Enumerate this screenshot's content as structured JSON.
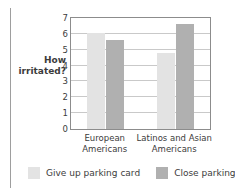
{
  "chart_data": {
    "type": "bar",
    "title": "",
    "xlabel": "",
    "ylabel": "How irritated?",
    "ylabel_lines": [
      "How",
      "irritated?"
    ],
    "ylim": [
      0,
      7
    ],
    "yticks": [
      0,
      1,
      2,
      3,
      4,
      5,
      6,
      7
    ],
    "grid": true,
    "legend_position": "bottom",
    "categories": [
      "European Americans",
      "Latinos and Asian Americans"
    ],
    "category_lines": [
      [
        "European",
        "Americans"
      ],
      [
        "Latinos and Asian",
        "Americans"
      ]
    ],
    "series": [
      {
        "name": "Give up parking card",
        "color": "#e3e3e3",
        "values": [
          6.05,
          4.8
        ]
      },
      {
        "name": "Close parking lot",
        "color": "#b0b0b0",
        "values": [
          5.6,
          6.65
        ]
      }
    ]
  },
  "axis": {
    "tick_0": "0",
    "tick_1": "1",
    "tick_2": "2",
    "tick_3": "3",
    "tick_4": "4",
    "tick_5": "5",
    "tick_6": "6",
    "tick_7": "7"
  },
  "colors": {
    "series_light": "#e3e3e3",
    "series_dark": "#b0b0b0",
    "gridline": "#c9c9c9",
    "frame": "#8c8c8c",
    "text": "#3c3c3c",
    "left_rule": "#9e9e9e"
  }
}
